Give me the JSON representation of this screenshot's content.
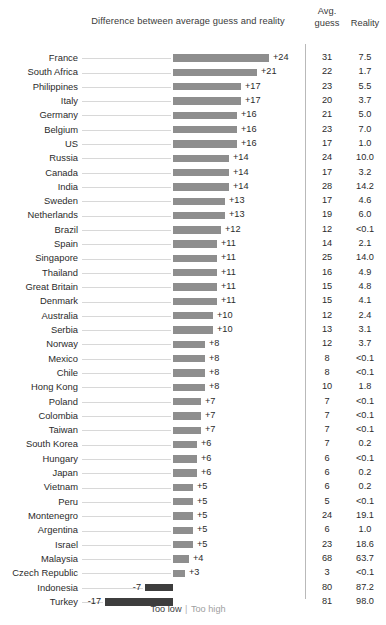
{
  "header": {
    "title": "Difference between average guess and reality",
    "avg_guess_line1": "Avg.",
    "avg_guess_line2": "guess",
    "reality": "Reality"
  },
  "legend": {
    "too_low": "Too low",
    "separator": "|",
    "too_high": "Too high"
  },
  "colors": {
    "bar_positive": "#8e8e8e",
    "bar_negative": "#3d3d3d",
    "leader_line": "#d8d8d8",
    "divider": "#b9b9b9",
    "text": "#2b2b2b",
    "background": "#ffffff"
  },
  "chart_data": {
    "type": "bar",
    "title": "Difference between average guess and reality",
    "xlabel": "",
    "ylabel": "",
    "orientation": "horizontal",
    "grid": false,
    "legend_position": "bottom",
    "legend_entries": [
      "Too low",
      "Too high"
    ],
    "px_per_unit": 4,
    "zero_line_x": 173,
    "xlim": [
      -17,
      24
    ],
    "columns": [
      "Country",
      "Difference",
      "Avg. guess",
      "Reality"
    ],
    "categories": [
      "France",
      "South Africa",
      "Philippines",
      "Italy",
      "Germany",
      "Belgium",
      "US",
      "Russia",
      "Canada",
      "India",
      "Sweden",
      "Netherlands",
      "Brazil",
      "Spain",
      "Singapore",
      "Thailand",
      "Great Britain",
      "Denmark",
      "Australia",
      "Serbia",
      "Norway",
      "Mexico",
      "Chile",
      "Hong Kong",
      "Poland",
      "Colombia",
      "Taiwan",
      "South Korea",
      "Hungary",
      "Japan",
      "Vietnam",
      "Peru",
      "Montenegro",
      "Argentina",
      "Israel",
      "Malaysia",
      "Czech Republic",
      "Indonesia",
      "Turkey"
    ],
    "values": [
      24,
      21,
      17,
      17,
      16,
      16,
      16,
      14,
      14,
      14,
      13,
      13,
      12,
      11,
      11,
      11,
      11,
      11,
      10,
      10,
      8,
      8,
      8,
      8,
      7,
      7,
      7,
      6,
      6,
      6,
      5,
      5,
      5,
      5,
      5,
      4,
      3,
      -7,
      -17
    ],
    "value_labels": [
      "+24",
      "+21",
      "+17",
      "+17",
      "+16",
      "+16",
      "+16",
      "+14",
      "+14",
      "+14",
      "+13",
      "+13",
      "+12",
      "+11",
      "+11",
      "+11",
      "+11",
      "+11",
      "+10",
      "+10",
      "+8",
      "+8",
      "+8",
      "+8",
      "+7",
      "+7",
      "+7",
      "+6",
      "+6",
      "+6",
      "+5",
      "+5",
      "+5",
      "+5",
      "+5",
      "+4",
      "+3",
      "-7",
      "-17"
    ],
    "avg_guess": [
      "31",
      "22",
      "23",
      "20",
      "21",
      "23",
      "17",
      "24",
      "17",
      "28",
      "17",
      "19",
      "12",
      "14",
      "25",
      "16",
      "15",
      "15",
      "12",
      "13",
      "12",
      "8",
      "8",
      "10",
      "7",
      "7",
      "7",
      "7",
      "6",
      "6",
      "6",
      "5",
      "24",
      "6",
      "23",
      "68",
      "3",
      "80",
      "81"
    ],
    "reality": [
      "7.5",
      "1.7",
      "5.5",
      "3.7",
      "5.0",
      "7.0",
      "1.0",
      "10.0",
      "3.2",
      "14.2",
      "4.6",
      "6.0",
      "<0.1",
      "2.1",
      "14.0",
      "4.9",
      "4.8",
      "4.1",
      "2.4",
      "3.1",
      "3.7",
      "<0.1",
      "<0.1",
      "1.8",
      "<0.1",
      "<0.1",
      "<0.1",
      "0.2",
      "<0.1",
      "0.2",
      "0.2",
      "<0.1",
      "19.1",
      "1.0",
      "18.6",
      "63.7",
      "<0.1",
      "87.2",
      "98.0"
    ]
  }
}
